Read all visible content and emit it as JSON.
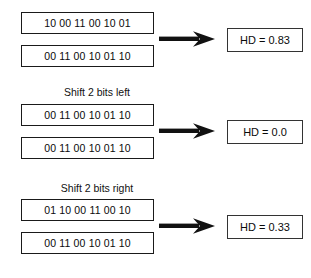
{
  "figure": {
    "colors": {
      "background": "#ffffff",
      "box_border": "#1a1a1a",
      "text": "#0a0a0a",
      "arrow": "#111111"
    },
    "sections": [
      {
        "label": "",
        "top_bits": "10 00 11 00 10 01",
        "bottom_bits": "00 11 00 10 01 10",
        "arrow": "right-arrow-icon",
        "result": "HD = 0.83",
        "result_value": 0.83
      },
      {
        "label": "Shift 2 bits left",
        "top_bits": "00 11 00 10 01 10",
        "bottom_bits": "00 11 00 10 01 10",
        "arrow": "right-arrow-icon",
        "result": "HD = 0.0",
        "result_value": 0.0
      },
      {
        "label": "Shift 2 bits right",
        "top_bits": "01 10 00 11 00 10",
        "bottom_bits": "00 11 00 10 01 10",
        "arrow": "right-arrow-icon",
        "result": "HD = 0.33",
        "result_value": 0.33
      }
    ]
  }
}
